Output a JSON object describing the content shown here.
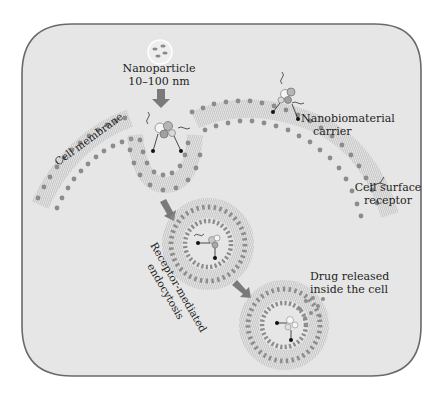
{
  "figure": {
    "background": "#e6e6e6",
    "frame_color": "#6a6a6a",
    "lipid_head_color": "#8c8c8c",
    "lipid_tail_color": "#9a9a9a",
    "arrow_color": "#7a7a7a"
  },
  "labels": {
    "nanoparticle_line1": "Nanoparticle",
    "nanoparticle_line2": "10–100 nm",
    "cell_membrane": "Cell membrane",
    "carrier_line1": "Nanobiomaterial",
    "carrier_line2": "carrier",
    "receptor_line1": "Cell surface",
    "receptor_line2": "receptor",
    "endocytosis_line1": "Receptor-mediated",
    "endocytosis_line2": "endocytosis",
    "drug_line1": "Drug released",
    "drug_line2": "inside the cell"
  },
  "stages": [
    {
      "name": "nanoparticle",
      "description": "Free nanoparticles 10–100 nm"
    },
    {
      "name": "membrane-binding",
      "description": "Carrier binds cell surface receptors; membrane invaginates"
    },
    {
      "name": "endosome",
      "description": "Receptor-mediated endocytosis forms vesicle"
    },
    {
      "name": "drug-release",
      "description": "Drug released inside the cell"
    }
  ]
}
